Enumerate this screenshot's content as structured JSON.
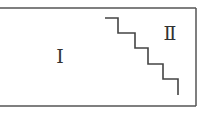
{
  "diagram": {
    "regions": [
      {
        "id": "region-1",
        "label": "Ⅰ"
      },
      {
        "id": "region-2",
        "label": "Ⅱ"
      }
    ],
    "boundary": {
      "type": "staircase",
      "steps": 4
    },
    "colors": {
      "stroke": "#444444",
      "text": "#333333",
      "background": "#ffffff"
    }
  }
}
